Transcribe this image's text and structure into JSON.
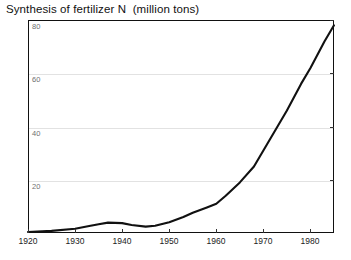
{
  "chart_data": {
    "type": "line",
    "title": "Synthesis of fertilizer N  (million tons)",
    "xlabel": "",
    "ylabel": "",
    "xlim": [
      1920,
      1985
    ],
    "ylim": [
      0,
      80
    ],
    "grid": true,
    "legend": false,
    "series": [
      {
        "name": "Synthesis of fertilizer N",
        "color": "#111111",
        "x": [
          1920,
          1925,
          1930,
          1933,
          1935,
          1937,
          1940,
          1942,
          1945,
          1947,
          1950,
          1953,
          1955,
          1958,
          1960,
          1962,
          1965,
          1968,
          1970,
          1973,
          1975,
          1978,
          1980,
          1983,
          1985
        ],
        "values": [
          0.4,
          0.8,
          1.6,
          2.6,
          3.3,
          3.9,
          3.7,
          3.0,
          2.4,
          2.7,
          4.0,
          6.0,
          7.6,
          9.6,
          11.0,
          14.0,
          19.0,
          25.0,
          31.0,
          40.0,
          46.0,
          56.0,
          62.0,
          72.0,
          78.0
        ]
      }
    ],
    "y_ticks": [
      {
        "value": 20,
        "label": "20"
      },
      {
        "value": 40,
        "label": "40"
      },
      {
        "value": 60,
        "label": "60"
      },
      {
        "value": 80,
        "label": "80"
      }
    ],
    "x_ticks": [
      {
        "value": 1920,
        "label": "1920"
      },
      {
        "value": 1930,
        "label": "1930"
      },
      {
        "value": 1940,
        "label": "1940"
      },
      {
        "value": 1950,
        "label": "1950"
      },
      {
        "value": 1960,
        "label": "1960"
      },
      {
        "value": 1970,
        "label": "1970"
      },
      {
        "value": 1980,
        "label": "1980"
      }
    ]
  }
}
